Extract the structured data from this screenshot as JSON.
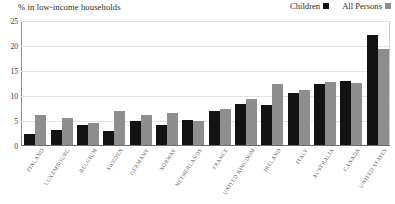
{
  "chart_data": {
    "type": "bar",
    "title": "% in low-income households",
    "xlabel": "",
    "ylabel": "",
    "ylim": [
      0,
      25
    ],
    "yticks": [
      0,
      5,
      10,
      15,
      20,
      25
    ],
    "grid": true,
    "legend_position": "top-right",
    "categories": [
      "FINLAND",
      "LUXEMBOURG",
      "BELGIUM",
      "SWEDEN",
      "GERMANY",
      "NORWAY",
      "NETHERLANDS",
      "FRANCE",
      "UNITED KINGDOM",
      "IRELAND",
      "ITALY",
      "AUSTRALIA",
      "CANADA",
      "UNITED STATES"
    ],
    "series": [
      {
        "name": "Children",
        "color": "#131313",
        "values": [
          2.2,
          3.0,
          4.0,
          2.8,
          4.8,
          4.0,
          5.0,
          6.8,
          8.3,
          8.0,
          10.5,
          12.2,
          12.8,
          22.0
        ]
      },
      {
        "name": "All Persons",
        "color": "#8e8e8e",
        "values": [
          6.0,
          5.5,
          4.4,
          6.8,
          6.0,
          6.4,
          4.8,
          7.3,
          9.3,
          12.3,
          11.0,
          12.7,
          12.5,
          19.3
        ]
      }
    ]
  }
}
